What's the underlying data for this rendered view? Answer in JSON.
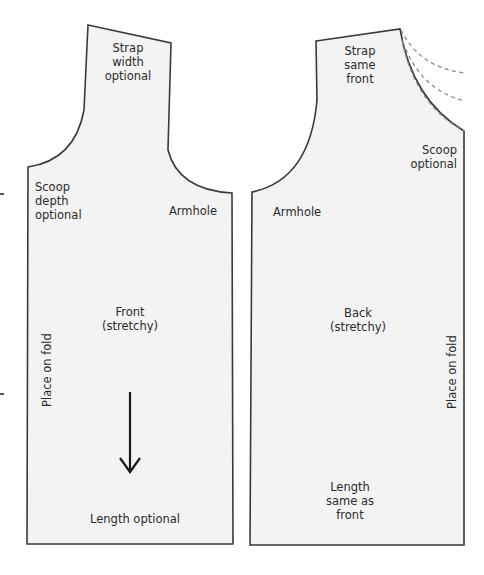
{
  "colors": {
    "piece_fill": "#f3f3f3",
    "outline": "#3a3a3a",
    "dashed": "#8a8a8a",
    "text": "#2b2b2b"
  },
  "front_piece": {
    "title": "Front\n(stretchy)",
    "strap_note": "Strap\nwidth\noptional",
    "scoop_note": "Scoop\ndepth\noptional",
    "armhole_label": "Armhole",
    "fold_label": "Place on fold",
    "length_note": "Length optional",
    "grainline": "down-arrow"
  },
  "back_piece": {
    "title": "Back\n(stretchy)",
    "strap_note": "Strap\nsame\nfront",
    "scoop_note": "Scoop\noptional",
    "armhole_label": "Armhole",
    "fold_label": "Place on fold",
    "length_note": "Length\nsame as\nfront",
    "alt_necklines": "dashed-curves-3"
  }
}
